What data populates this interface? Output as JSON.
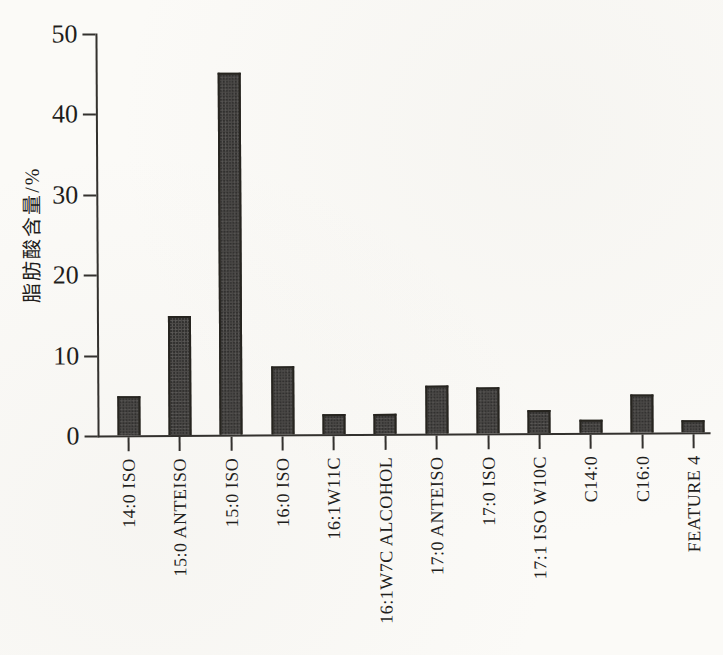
{
  "figure": {
    "kind": "scanned-book-figure",
    "paper_color": "#fbfaf7",
    "axis_color": "#33312e",
    "text_color": "#1f1e1c"
  },
  "chart_data": {
    "type": "bar",
    "title": "",
    "xlabel": "",
    "ylabel": "脂肪酸含量/%",
    "ylim": [
      0,
      50
    ],
    "yticks": [
      0,
      10,
      20,
      30,
      40,
      50
    ],
    "grid": false,
    "legend": null,
    "bar_color": "#4c4a48",
    "bar_border_color": "#26241f",
    "categories": [
      "14:0 ISO",
      "15:0 ANTEISO",
      "15:0 ISO",
      "16:0 ISO",
      "16:1W11C",
      "16:1W7C ALCOHOL",
      "17:0 ANTEISO",
      "17:0 ISO",
      "17:1 ISO W10C",
      "C14:0",
      "C16:0",
      "FEATURE 4"
    ],
    "values": [
      4.8,
      14.8,
      45.0,
      8.5,
      2.5,
      2.5,
      6.0,
      5.7,
      2.9,
      1.6,
      4.7,
      1.5
    ]
  }
}
